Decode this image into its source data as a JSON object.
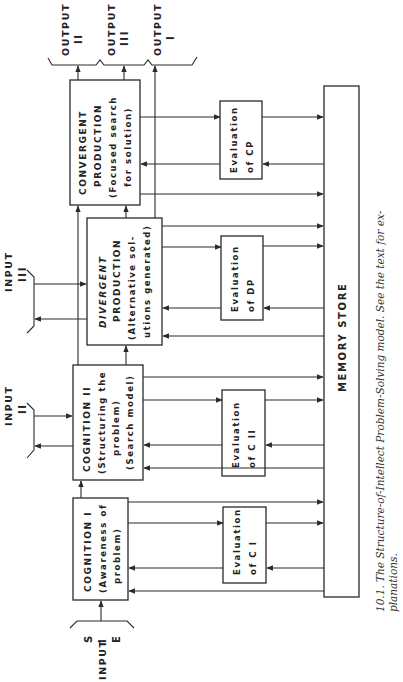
{
  "figure": {
    "caption_line1": "10.1. The Structure-of-Intellect Problem-Solving model. See the text for ex-",
    "caption_line2": "planations."
  },
  "outputs": [
    {
      "label": "OUTPUT",
      "numeral": "II"
    },
    {
      "label": "OUTPUT",
      "numeral": "III"
    },
    {
      "label": "OUTPUT",
      "numeral": "I"
    }
  ],
  "inputs": [
    {
      "label": "INPUT",
      "numeral": "I",
      "side_marks": [
        "S",
        "E"
      ]
    },
    {
      "label": "INPUT",
      "numeral": "II"
    },
    {
      "label": "INPUT",
      "numeral": "III"
    }
  ],
  "boxes": {
    "convergent": {
      "line1": "CONVERGENT",
      "line2": "PRODUCTION",
      "line3": "(Focused search",
      "line4": "for solution)"
    },
    "divergent": {
      "line1": "DIVERGENT",
      "line2": "PRODUCTION",
      "line3": "(Alternative sol-",
      "line4": "utions generated)"
    },
    "cognition2": {
      "line1": "COGNITION II",
      "line2": "(Structuring the",
      "line3": "problem)",
      "line4": "(Search model)"
    },
    "cognition1": {
      "line1": "COGNITION I",
      "line2": "(Awareness of",
      "line3": "problem)"
    },
    "eval_cp": {
      "line1": "Evaluation",
      "line2": "of   CP"
    },
    "eval_dp": {
      "line1": "Evaluation",
      "line2": "of   DP"
    },
    "eval_c2": {
      "line1": "Evaluation",
      "line2": "of  C II"
    },
    "eval_c1": {
      "line1": "Evaluation",
      "line2": "of   C I"
    },
    "memory": {
      "label": "MEMORY   STORE"
    }
  },
  "colors": {
    "ink": "#2a2a2a",
    "paper": "#ffffff"
  }
}
